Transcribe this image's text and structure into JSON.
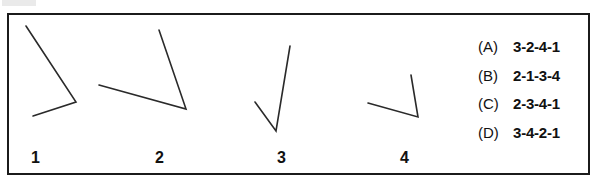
{
  "figure": {
    "border_color": "#1b1b1b",
    "stroke_color": "#2a2a2a",
    "background": "#ffffff",
    "angles": [
      {
        "id": "angle-1",
        "label": "1",
        "label_x": 31,
        "label_y": 150,
        "vertex": [
          76,
          102
        ],
        "arm_a_end": [
          26,
          26
        ],
        "arm_b_end": [
          33,
          116
        ]
      },
      {
        "id": "angle-2",
        "label": "2",
        "label_x": 155,
        "label_y": 150,
        "vertex": [
          186,
          109
        ],
        "arm_a_end": [
          159,
          30
        ],
        "arm_b_end": [
          99,
          85
        ]
      },
      {
        "id": "angle-3",
        "label": "3",
        "label_x": 277,
        "label_y": 150,
        "vertex": [
          276,
          131
        ],
        "arm_a_end": [
          290,
          46
        ],
        "arm_b_end": [
          255,
          102
        ]
      },
      {
        "id": "angle-4",
        "label": "4",
        "label_x": 400,
        "label_y": 150,
        "vertex": [
          418,
          117
        ],
        "arm_a_end": [
          411,
          75
        ],
        "arm_b_end": [
          368,
          103
        ]
      }
    ]
  },
  "options": [
    {
      "letter": "(A)",
      "value": "3-2-4-1"
    },
    {
      "letter": "(B)",
      "value": "2-1-3-4"
    },
    {
      "letter": "(C)",
      "value": "2-3-4-1"
    },
    {
      "letter": "(D)",
      "value": "3-4-2-1"
    }
  ]
}
